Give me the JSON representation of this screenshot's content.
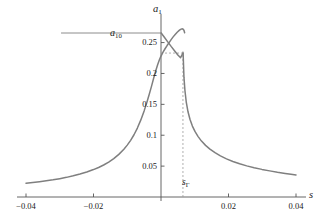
{
  "chart_data": {
    "type": "line",
    "title": "",
    "subtitle": "",
    "xlabel": "s",
    "ylabel": "a_1",
    "xlim": [
      -0.04,
      0.04
    ],
    "ylim": [
      0,
      0.285
    ],
    "grid": false,
    "legend_position": "none",
    "xticks": [
      -0.04,
      -0.02,
      0.02,
      0.04
    ],
    "xtick_labels": [
      "-0.04",
      "-0.02",
      "0.02",
      "0.04"
    ],
    "yticks": [
      0.05,
      0.1,
      0.15,
      0.2,
      0.25
    ],
    "ytick_labels": [
      "0.05",
      "0.1",
      "0.15",
      "0.2",
      "0.25"
    ],
    "annotations": [
      {
        "name": "a10-reference-label",
        "text": "a10",
        "value_y": 0.265,
        "kind": "horizontal-reference-line"
      },
      {
        "name": "s-gamma-marker-label",
        "text": "sG",
        "value_x": 0.0065,
        "kind": "vertical-dashed-line"
      },
      {
        "name": "jump-level-dashed",
        "value_y": 0.233,
        "kind": "horizontal-dashed-line"
      }
    ],
    "series": [
      {
        "name": "resonance-response-upper",
        "color": "#7f7f7f",
        "style": "solid",
        "points": [
          [
            -0.04,
            0.0222
          ],
          [
            -0.038,
            0.0234
          ],
          [
            -0.036,
            0.0247
          ],
          [
            -0.034,
            0.0262
          ],
          [
            -0.032,
            0.0278
          ],
          [
            -0.03,
            0.0297
          ],
          [
            -0.028,
            0.0318
          ],
          [
            -0.026,
            0.0343
          ],
          [
            -0.024,
            0.0371
          ],
          [
            -0.022,
            0.0404
          ],
          [
            -0.02,
            0.0444
          ],
          [
            -0.0185,
            0.0478
          ],
          [
            -0.017,
            0.0518
          ],
          [
            -0.0155,
            0.0565
          ],
          [
            -0.014,
            0.0621
          ],
          [
            -0.0125,
            0.069
          ],
          [
            -0.011,
            0.0774
          ],
          [
            -0.01,
            0.084
          ],
          [
            -0.009,
            0.0917
          ],
          [
            -0.008,
            0.1008
          ],
          [
            -0.007,
            0.1116
          ],
          [
            -0.006,
            0.1244
          ],
          [
            -0.005,
            0.1394
          ],
          [
            -0.0042,
            0.153
          ],
          [
            -0.0035,
            0.166
          ],
          [
            -0.0028,
            0.1795
          ],
          [
            -0.0022,
            0.1918
          ],
          [
            -0.0016,
            0.2035
          ],
          [
            -0.001,
            0.214
          ],
          [
            -0.0005,
            0.2218
          ],
          [
            0.0,
            0.2282
          ],
          [
            0.0006,
            0.2345
          ],
          [
            0.0012,
            0.24
          ],
          [
            0.0018,
            0.2452
          ],
          [
            0.0024,
            0.25
          ],
          [
            0.003,
            0.2548
          ],
          [
            0.0036,
            0.2592
          ],
          [
            0.0042,
            0.2632
          ],
          [
            0.0048,
            0.2668
          ],
          [
            0.0054,
            0.2698
          ],
          [
            0.0058,
            0.2714
          ],
          [
            0.0062,
            0.2722
          ],
          [
            0.0065,
            0.272
          ],
          [
            0.0068,
            0.27
          ],
          [
            0.007,
            0.266
          ]
        ]
      },
      {
        "name": "resonance-response-lower-branch",
        "color": "#7f7f7f",
        "style": "solid",
        "points": [
          [
            0.00655,
            0.233
          ],
          [
            0.0068,
            0.194
          ],
          [
            0.0071,
            0.172
          ],
          [
            0.0075,
            0.153
          ],
          [
            0.008,
            0.138
          ],
          [
            0.0086,
            0.1255
          ],
          [
            0.0093,
            0.1148
          ],
          [
            0.0101,
            0.1058
          ],
          [
            0.011,
            0.0978
          ],
          [
            0.012,
            0.0905
          ],
          [
            0.0132,
            0.0836
          ],
          [
            0.0145,
            0.0775
          ],
          [
            0.016,
            0.0717
          ],
          [
            0.0176,
            0.0665
          ],
          [
            0.0194,
            0.0617
          ],
          [
            0.0213,
            0.0575
          ],
          [
            0.0233,
            0.0537
          ],
          [
            0.0254,
            0.0504
          ],
          [
            0.0276,
            0.0474
          ],
          [
            0.0299,
            0.0447
          ],
          [
            0.0322,
            0.0423
          ],
          [
            0.0345,
            0.0401
          ],
          [
            0.0368,
            0.0382
          ],
          [
            0.0385,
            0.0369
          ],
          [
            0.04,
            0.0358
          ]
        ]
      },
      {
        "name": "unstable-branch",
        "color": "#7f7f7f",
        "style": "solid",
        "points": [
          [
            5e-05,
            0.2655
          ],
          [
            0.001,
            0.2585
          ],
          [
            0.002,
            0.2512
          ],
          [
            0.003,
            0.2438
          ],
          [
            0.004,
            0.2368
          ],
          [
            0.005,
            0.23
          ],
          [
            0.0058,
            0.2255
          ],
          [
            0.0065,
            0.233
          ]
        ]
      },
      {
        "name": "a10-horizontal-line",
        "color": "#7f7f7f",
        "style": "solid",
        "points": [
          [
            -0.0295,
            0.2655
          ],
          [
            0.0,
            0.2655
          ]
        ]
      }
    ]
  },
  "labels": {
    "y_axis_symbol": "a",
    "y_axis_sub": "1",
    "a10_symbol": "a",
    "a10_sub": "10",
    "x_axis_symbol": "s",
    "s_gamma_symbol": "s",
    "s_gamma_sub": "Γ"
  },
  "colors": {
    "curve": "#7f7f7f",
    "axis": "#555555",
    "dashed": "#9a9a9a",
    "text": "#1a1a1a",
    "background": "#ffffff"
  }
}
